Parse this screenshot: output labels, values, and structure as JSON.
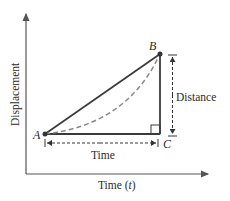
{
  "diagram": {
    "axes": {
      "x_label": "Time (",
      "x_label_var": "t",
      "x_label_close": ")",
      "y_label": "Displacement"
    },
    "points": {
      "a": "A",
      "b": "B",
      "c": "C"
    },
    "annotations": {
      "distance": "Distance",
      "time": "Time"
    },
    "colors": {
      "solid_line": "#3a3a3a",
      "dashed_curve": "#8a8a8a",
      "axis": "#555555"
    }
  }
}
